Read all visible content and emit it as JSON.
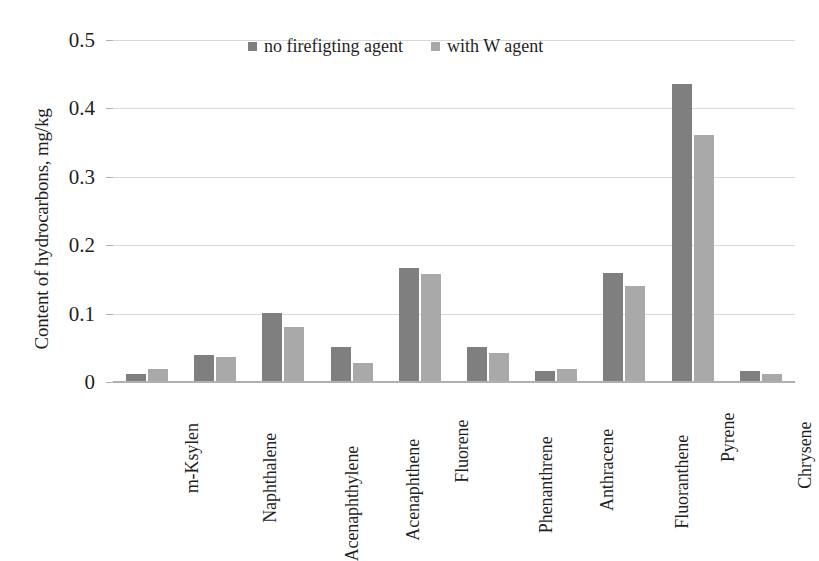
{
  "chart_data": {
    "type": "bar",
    "title": "",
    "xlabel": "",
    "ylabel": "Content of hydrocarbons, mg/kg",
    "ylim": [
      0,
      0.5
    ],
    "yticks": [
      "0",
      "0.1",
      "0.2",
      "0.3",
      "0.4",
      "0.5"
    ],
    "ytick_values": [
      0,
      0.1,
      0.2,
      0.3,
      0.4,
      0.5
    ],
    "grid": true,
    "legend_position": "top-center",
    "categories": [
      "m-Ksylen",
      "Naphthalene",
      "Acenaphthylene",
      "Acenaphthene",
      "Fluorene",
      "Phenanthrene",
      "Anthracene",
      "Fluoranthene",
      "Pyrene",
      "Chrysene"
    ],
    "series": [
      {
        "name": "no firefigting agent",
        "color": "#7f7f7f",
        "values": [
          0.011,
          0.04,
          0.101,
          0.051,
          0.166,
          0.051,
          0.016,
          0.16,
          0.435,
          0.016
        ]
      },
      {
        "name": "with W agent",
        "color": "#a9a9a9",
        "values": [
          0.019,
          0.037,
          0.08,
          0.028,
          0.158,
          0.042,
          0.019,
          0.141,
          0.361,
          0.012
        ]
      }
    ]
  },
  "colors": {
    "series_dark": "#7f7f7f",
    "series_light": "#a9a9a9",
    "gridline": "#d9d9d9",
    "axis": "#b0b0b0",
    "text": "#1f1f1f",
    "background": "#ffffff"
  }
}
